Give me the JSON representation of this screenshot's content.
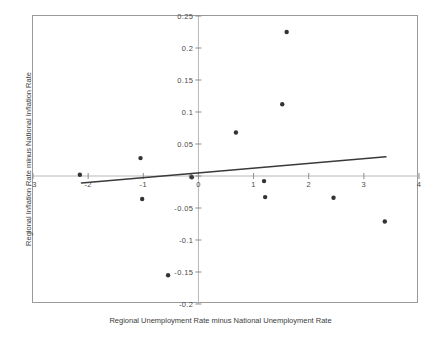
{
  "chart_data": {
    "type": "scatter",
    "title": "",
    "xlabel": "Regional Unemployment Rate minus National Unemployment Rate",
    "ylabel": "Regional Inflation Rate minus National Inflation Rate",
    "xlim": [
      -3,
      4
    ],
    "ylim": [
      -0.2,
      0.25
    ],
    "xticks": [
      -3,
      -2,
      -1,
      0,
      1,
      2,
      3,
      4
    ],
    "xticklabels": [
      "-3",
      "-2",
      "-1",
      "0",
      "1",
      "2",
      "3",
      "4"
    ],
    "yticks": [
      -0.2,
      -0.15,
      -0.1,
      -0.05,
      0,
      0.05,
      0.1,
      0.15,
      0.2,
      0.25
    ],
    "yticklabels": [
      "-0.2",
      "-0.15",
      "-0.1",
      "-0.05",
      "0",
      "0.05",
      "0.1",
      "0.15",
      "0.2",
      "0.25"
    ],
    "grid": false,
    "legend": null,
    "series": [
      {
        "name": "regions",
        "type": "scatter",
        "marker": "circle",
        "color": "#333333",
        "points": [
          {
            "x": -2.15,
            "y": 0.002
          },
          {
            "x": -1.05,
            "y": 0.028
          },
          {
            "x": -1.02,
            "y": -0.036
          },
          {
            "x": -0.55,
            "y": -0.155
          },
          {
            "x": -0.12,
            "y": -0.002
          },
          {
            "x": 0.68,
            "y": 0.068
          },
          {
            "x": 1.19,
            "y": -0.008
          },
          {
            "x": 1.21,
            "y": -0.033
          },
          {
            "x": 1.52,
            "y": 0.112
          },
          {
            "x": 1.6,
            "y": 0.225
          },
          {
            "x": 2.45,
            "y": -0.034
          },
          {
            "x": 3.38,
            "y": -0.071
          }
        ]
      },
      {
        "name": "fitted regression line",
        "type": "line",
        "color": "#3a3a3a",
        "x_start": -2.12,
        "y_start": -0.011,
        "x_end": 3.4,
        "y_end": 0.03
      }
    ],
    "reference_lines": [
      {
        "axis": "y",
        "value": 0,
        "color": "#b8b8b8"
      },
      {
        "axis": "x",
        "value": 0,
        "color": "#b8b8b8"
      }
    ]
  }
}
